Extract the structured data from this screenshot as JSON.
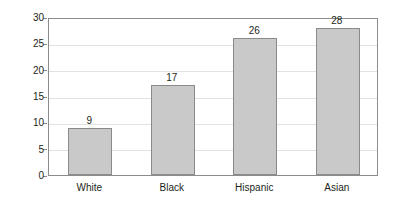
{
  "chart_data": {
    "type": "bar",
    "title": "",
    "xlabel": "",
    "ylabel": "Percent",
    "categories": [
      "White",
      "Black",
      "Hispanic",
      "Asian"
    ],
    "values": [
      9,
      17,
      26,
      28
    ],
    "value_labels": [
      "9",
      "17",
      "26",
      "28"
    ],
    "ylim": [
      0,
      30
    ],
    "y_ticks": [
      0,
      5,
      10,
      15,
      20,
      25,
      30
    ],
    "y_tick_labels": [
      "0",
      "5",
      "10",
      "15",
      "20",
      "25",
      "30"
    ],
    "grid": true,
    "legend": false,
    "legend_position": "none",
    "series": [
      {
        "name": "Percent",
        "values": [
          9,
          17,
          26,
          28
        ]
      }
    ]
  },
  "style": {
    "bar_fill": "#c9c9c9",
    "bar_border": "#8a8a8a",
    "frame_color": "#8c8c8c",
    "grid_color": "#e2e2e2",
    "text_color": "#231f20",
    "background": "#ffffff"
  }
}
